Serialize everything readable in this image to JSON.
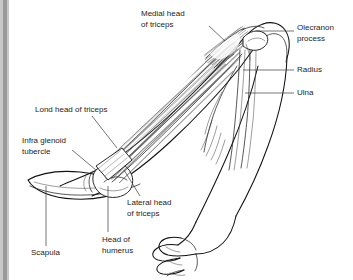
{
  "figure": {
    "view": "lateral-posterior",
    "canvas": {
      "width": 353,
      "height": 280
    },
    "background_color": "#ffffff",
    "line_color": "#111111",
    "label_color": "#1d1d1d",
    "leader_color": "#3a3a3a",
    "edge_band_color": "#9a9a9a"
  },
  "labels": [
    {
      "id": "medial-head-of-triceps",
      "kind": "muscle",
      "lines": [
        "Medial head",
        "of triceps"
      ],
      "text_x": 141,
      "text_y": 14,
      "anchor": "start",
      "leader": "M 209 26 L 225 41"
    },
    {
      "id": "olecranon-process",
      "kind": "bone-landmark",
      "lines": [
        "Olecranon",
        "process"
      ],
      "text_x": 297,
      "text_y": 28,
      "anchor": "start",
      "leader": "M 294 31 L 256 31"
    },
    {
      "id": "radius",
      "kind": "bone",
      "lines": [
        "Radius"
      ],
      "text_x": 297,
      "text_y": 70,
      "anchor": "start",
      "leader": "M 294 70 L 243 70"
    },
    {
      "id": "ulna",
      "kind": "bone",
      "lines": [
        "Ulna"
      ],
      "text_x": 297,
      "text_y": 93,
      "anchor": "start",
      "leader": "M 294 93 L 245 93"
    },
    {
      "id": "long-head-of-triceps",
      "kind": "muscle",
      "lines": [
        "Lond head of triceps"
      ],
      "text_x": 35,
      "text_y": 110,
      "anchor": "start",
      "leader": "M 92 116 L 117 148"
    },
    {
      "id": "infra-glenoid-tubercle",
      "kind": "bone-landmark",
      "lines": [
        "Infra glenoid",
        "tubercle"
      ],
      "text_x": 22,
      "text_y": 141,
      "anchor": "start",
      "leader": "M 72 150 L 96 170"
    },
    {
      "id": "lateral-head-of-triceps",
      "kind": "muscle",
      "lines": [
        "Lateral head",
        "of triceps"
      ],
      "text_x": 127,
      "text_y": 203,
      "anchor": "start",
      "leader": "M 140 196 L 124 170"
    },
    {
      "id": "head-of-humerus",
      "kind": "bone-landmark",
      "lines": [
        "Head of",
        "humerus"
      ],
      "text_x": 102,
      "text_y": 240,
      "anchor": "start",
      "leader": "M 108 232 L 108 186"
    },
    {
      "id": "scapula",
      "kind": "bone",
      "lines": [
        "Scapula"
      ],
      "text_x": 31,
      "text_y": 253,
      "anchor": "start",
      "leader": "M 46 246 L 46 186"
    }
  ],
  "structures": {
    "arm_outline": "posterior upper arm and forearm, elbow flexed, fist clenched",
    "scapula": "flattened blade at lower left",
    "humerus_head": "rounded head at glenoid",
    "forearm_bones": [
      "radius",
      "ulna"
    ],
    "triceps_heads": [
      "long head",
      "lateral head",
      "medial head"
    ]
  }
}
